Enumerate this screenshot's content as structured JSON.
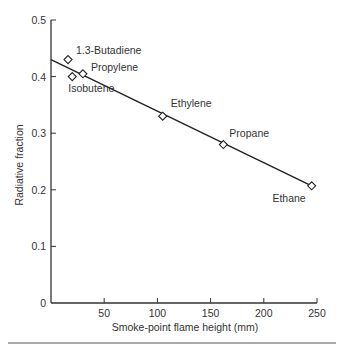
{
  "chart_data": {
    "type": "scatter",
    "title": "",
    "xlabel": "Smoke-point flame height (mm)",
    "ylabel": "Radiative fraction",
    "xlim": [
      0,
      250
    ],
    "ylim": [
      0,
      0.5
    ],
    "xticks": [
      50,
      100,
      150,
      200,
      250
    ],
    "xtick_labels": [
      "50",
      "100",
      "150",
      "200",
      "250"
    ],
    "yticks": [
      0,
      0.1,
      0.2,
      0.3,
      0.4,
      0.5
    ],
    "ytick_labels": [
      "0",
      "0.1",
      "0.2",
      "0.3",
      "0.4",
      "0.5"
    ],
    "grid": false,
    "marker": "open-diamond",
    "points": [
      {
        "label": "1.3-Butadiene",
        "x": 16,
        "y": 0.43
      },
      {
        "label": "Isobutene",
        "x": 20,
        "y": 0.4
      },
      {
        "label": "Propylene",
        "x": 30,
        "y": 0.405
      },
      {
        "label": "Ethylene",
        "x": 105,
        "y": 0.33
      },
      {
        "label": "Propane",
        "x": 162,
        "y": 0.28
      },
      {
        "label": "Ethane",
        "x": 245,
        "y": 0.207
      }
    ],
    "fit_line": {
      "x": [
        0,
        245
      ],
      "y": [
        0.43,
        0.207
      ]
    }
  },
  "colors": {
    "axis": "#333333",
    "text": "#333333",
    "marker_fill": "#ffffff"
  }
}
